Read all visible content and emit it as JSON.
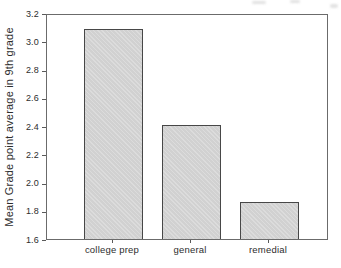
{
  "chart_data": {
    "type": "bar",
    "title": "",
    "xlabel": "",
    "ylabel": "Mean Grade point average in 9th grade",
    "categories": [
      "college prep",
      "general",
      "remedial"
    ],
    "values": [
      3.09,
      2.41,
      1.86
    ],
    "ylim": [
      1.6,
      3.2
    ],
    "yticks": [
      3.2,
      3.0,
      2.8,
      2.6,
      2.4,
      2.2,
      2.0,
      1.8,
      1.6
    ],
    "grid": false,
    "legend": "none",
    "colors": {
      "bar_fill": "#d4d4d4",
      "bar_border": "#474747",
      "frame": "#6b6b6b",
      "tick": "#5a5a5a",
      "text": "#2d2d2d",
      "background": "#ffffff"
    }
  }
}
